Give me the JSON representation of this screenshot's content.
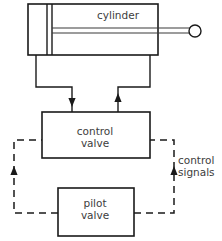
{
  "diagram": {
    "colors": {
      "line": "#1a1a1a",
      "text": "#3d3d3d",
      "background": "#ffffff"
    },
    "components": {
      "cylinder": {
        "label": "cylinder",
        "label_x": 118,
        "label_y": 19
      },
      "control_valve": {
        "label_line1": "control",
        "label_line2": "valve",
        "label_x": 95,
        "label_y1": 135,
        "label_y2": 147
      },
      "pilot_valve": {
        "label_line1": "pilot",
        "label_line2": "valve",
        "label_x": 95,
        "label_y1": 207,
        "label_y2": 219
      }
    },
    "annotations": {
      "control_signals": {
        "line1": "control",
        "line2": "signals",
        "x": 178,
        "y1": 164,
        "y2": 176
      }
    }
  }
}
